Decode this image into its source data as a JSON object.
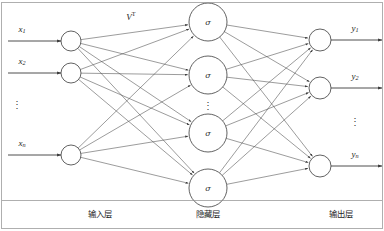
{
  "figure": {
    "canvas": {
      "width": 384,
      "height": 231
    },
    "colors": {
      "stroke": "#3a3a3a",
      "edge": "#4a4a4a",
      "node_fill": "#ffffff",
      "text": "#1d1d1d",
      "frame": "#8c8c8c"
    }
  },
  "weights": {
    "label_base": "V",
    "label_sup": "T"
  },
  "layers": {
    "input": {
      "name_cn": "输入层",
      "name_cn_x": 100,
      "name_cn_y": 214,
      "node_radius": 10,
      "node_x": 71,
      "nodes": [
        {
          "id": "x1",
          "cy": 41,
          "label_base": "x",
          "label_sub": "1",
          "label_x": 22,
          "label_y": 30,
          "arrow_x1": 8,
          "arrow_x2": 61
        },
        {
          "id": "x2",
          "cy": 73,
          "label_base": "x",
          "label_sub": "2",
          "label_x": 22,
          "label_y": 62,
          "arrow_x1": 8,
          "arrow_x2": 61
        },
        {
          "id": "xn",
          "cy": 155,
          "label_base": "x",
          "label_sub": "n",
          "label_x": 22,
          "label_y": 144,
          "arrow_x1": 8,
          "arrow_x2": 61
        }
      ],
      "ellipsis": {
        "x": 17,
        "y": 106,
        "glyph": "⋮"
      }
    },
    "hidden": {
      "name_cn": "隐藏层",
      "name_cn_x": 208,
      "name_cn_y": 214,
      "node_radius": 19,
      "node_x": 208,
      "activation_glyph": "σ",
      "nodes": [
        {
          "id": "h1",
          "cy": 22
        },
        {
          "id": "h2",
          "cy": 75
        },
        {
          "id": "h3",
          "cy": 133
        },
        {
          "id": "h4",
          "cy": 188
        }
      ],
      "ellipsis": {
        "x": 208,
        "y": 107,
        "glyph": "⋮"
      }
    },
    "output": {
      "name_cn": "输出层",
      "name_cn_x": 341,
      "name_cn_y": 214,
      "node_radius": 11,
      "node_x": 320,
      "nodes": [
        {
          "id": "y1",
          "cy": 40,
          "label_base": "y",
          "label_sub": "1",
          "label_x": 355,
          "label_y": 29,
          "arrow_x1": 331,
          "arrow_x2": 382
        },
        {
          "id": "y2",
          "cy": 88,
          "label_base": "y",
          "label_sub": "2",
          "label_x": 355,
          "label_y": 77,
          "arrow_x1": 331,
          "arrow_x2": 382
        },
        {
          "id": "yn",
          "cy": 166,
          "label_base": "y",
          "label_sub": "n",
          "label_x": 355,
          "label_y": 155,
          "arrow_x1": 331,
          "arrow_x2": 382
        }
      ],
      "ellipsis": {
        "x": 355,
        "y": 123,
        "glyph": "⋮"
      }
    }
  }
}
